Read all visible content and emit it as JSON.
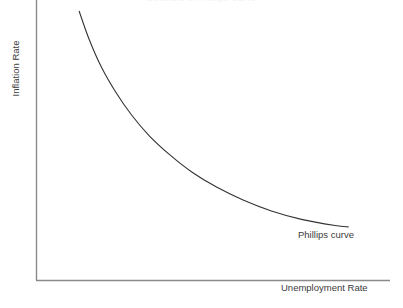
{
  "chart_data": {
    "type": "line",
    "title": "Structure of Phillips Curve",
    "xlabel": "Unemployment Rate",
    "ylabel": "Inflation Rate",
    "annotations": [
      {
        "text": "Phillips curve",
        "x": 0.86,
        "y": 0.21
      }
    ],
    "grid": false,
    "legend": false,
    "xlim": [
      0,
      1
    ],
    "ylim": [
      0,
      1
    ],
    "axis_ticks": {
      "x": [],
      "y": []
    },
    "series": [
      {
        "name": "Phillips curve",
        "color": "#333333",
        "x": [
          0.122,
          0.15,
          0.185,
          0.225,
          0.27,
          0.32,
          0.38,
          0.44,
          0.51,
          0.585,
          0.665,
          0.75,
          0.845,
          0.882
        ],
        "y": [
          0.96,
          0.86,
          0.76,
          0.672,
          0.59,
          0.516,
          0.446,
          0.387,
          0.333,
          0.287,
          0.248,
          0.218,
          0.196,
          0.191
        ]
      }
    ]
  },
  "axes": {
    "x_axis_name": "x-axis",
    "y_axis_name": "y-axis",
    "color": "#8a8a8a"
  }
}
